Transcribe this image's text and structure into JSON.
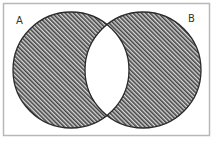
{
  "diagram": {
    "type": "venn",
    "sets": [
      {
        "id": "A",
        "label": "A",
        "shaded": true
      },
      {
        "id": "B",
        "label": "B",
        "shaded": true
      }
    ],
    "intersection": {
      "label": "A ∩ B",
      "shaded": false
    },
    "shaded_region_description": "(A ∪ B) − (A ∩ B)",
    "colors": {
      "background": "#ffffff",
      "frame_border": "#b8b8b8",
      "circle_stroke": "#2a2a2a",
      "hatch_line": "#444444",
      "hatch_background": "#d8d8d8",
      "intersection_fill": "#ffffff",
      "label_text": "#333333"
    }
  }
}
